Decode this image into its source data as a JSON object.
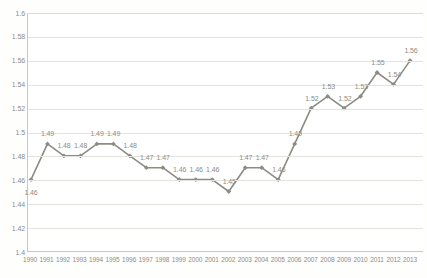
{
  "chart_data": {
    "type": "line",
    "title": "",
    "subtitle": "",
    "xlabel": "",
    "ylabel": "",
    "categories": [
      "1990",
      "1991",
      "1992",
      "1993",
      "1994",
      "1995",
      "1996",
      "1997",
      "1998",
      "1999",
      "2000",
      "2001",
      "2002",
      "2003",
      "2004",
      "2005",
      "2006",
      "2007",
      "2008",
      "2009",
      "2010",
      "2011",
      "2012",
      "2013"
    ],
    "values": [
      1.46,
      1.49,
      1.48,
      1.48,
      1.49,
      1.49,
      1.48,
      1.47,
      1.47,
      1.46,
      1.46,
      1.46,
      1.45,
      1.47,
      1.47,
      1.46,
      1.49,
      1.52,
      1.53,
      1.52,
      1.53,
      1.55,
      1.54,
      1.56
    ],
    "point_labels": [
      "1.46",
      "1.49",
      "1.48",
      "1.48",
      "1.49",
      "1.49",
      "1.48",
      "1.47",
      "1.47",
      "1.46",
      "1.46",
      "1.46",
      "1.45",
      "1.47",
      "1.47",
      "1.46",
      "1.49",
      "1.52",
      "1.53",
      "1.52",
      "1.53",
      "1.55",
      "1.54",
      "1.56"
    ],
    "ylim": [
      1.4,
      1.6
    ],
    "ytick_step": 0.02,
    "ytick_labels": [
      "1.6",
      "1.58",
      "1.56",
      "1.54",
      "1.52",
      "1.5",
      "1.48",
      "1.46",
      "1.44",
      "1.42",
      "1.4"
    ],
    "ytick_values": [
      1.6,
      1.58,
      1.56,
      1.54,
      1.52,
      1.5,
      1.48,
      1.46,
      1.44,
      1.42,
      1.4
    ],
    "grid": true,
    "legend": false,
    "legend_position": "none",
    "series": [
      {
        "name": "series-1",
        "values": [
          1.46,
          1.49,
          1.48,
          1.48,
          1.49,
          1.49,
          1.48,
          1.47,
          1.47,
          1.46,
          1.46,
          1.46,
          1.45,
          1.47,
          1.47,
          1.46,
          1.49,
          1.52,
          1.53,
          1.52,
          1.53,
          1.55,
          1.54,
          1.56
        ]
      }
    ],
    "colors": {
      "line": "#8c8c84",
      "marker": "#8c8c84",
      "grid": "#e4e4de",
      "axis": "#c9c9c2",
      "label_text": "#8d8d85",
      "plot_background": "#ffffff",
      "page_background": "#fefefd"
    },
    "label_offsets_above": [
      false,
      true,
      true,
      true,
      true,
      true,
      true,
      true,
      true,
      true,
      true,
      true,
      true,
      true,
      true,
      true,
      true,
      true,
      true,
      true,
      true,
      true,
      true,
      true
    ]
  }
}
